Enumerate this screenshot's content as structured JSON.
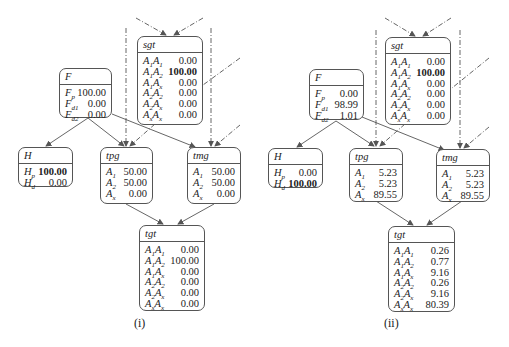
{
  "panels": [
    {
      "caption": "(i)",
      "nodes": {
        "sgt": {
          "title": "sgt",
          "rows": [
            {
              "label": "A1A1",
              "value": "0.00",
              "bold": false
            },
            {
              "label": "A1A2",
              "value": "100.00",
              "bold": true
            },
            {
              "label": "A1Ax",
              "value": "0.00",
              "bold": false
            },
            {
              "label": "A2A2",
              "value": "0.00",
              "bold": false
            },
            {
              "label": "A2Ax",
              "value": "0.00",
              "bold": false
            },
            {
              "label": "AxAx",
              "value": "0.00",
              "bold": false
            }
          ]
        },
        "F": {
          "title": "F",
          "rows": [
            {
              "label": "Fp",
              "value": "100.00",
              "bold": false
            },
            {
              "label": "Fd1",
              "value": "0.00",
              "bold": false
            },
            {
              "label": "Fd2",
              "value": "0.00",
              "bold": false
            }
          ]
        },
        "H": {
          "title": "H",
          "rows": [
            {
              "label": "Hp",
              "value": "100.00",
              "bold": true
            },
            {
              "label": "Hd",
              "value": "0.00",
              "bold": false
            }
          ]
        },
        "tpg": {
          "title": "tpg",
          "rows": [
            {
              "label": "A1",
              "value": "50.00",
              "bold": false
            },
            {
              "label": "A2",
              "value": "50.00",
              "bold": false
            },
            {
              "label": "Ax",
              "value": "0.00",
              "bold": false
            }
          ]
        },
        "tmg": {
          "title": "tmg",
          "rows": [
            {
              "label": "A1",
              "value": "50.00",
              "bold": false
            },
            {
              "label": "A2",
              "value": "50.00",
              "bold": false
            },
            {
              "label": "Ax",
              "value": "0.00",
              "bold": false
            }
          ]
        },
        "tgt": {
          "title": "tgt",
          "rows": [
            {
              "label": "A1A1",
              "value": "0.00",
              "bold": false
            },
            {
              "label": "A1A2",
              "value": "100.00",
              "bold": false
            },
            {
              "label": "A1Ax",
              "value": "0.00",
              "bold": false
            },
            {
              "label": "A2A2",
              "value": "0.00",
              "bold": false
            },
            {
              "label": "A2Ax",
              "value": "0.00",
              "bold": false
            },
            {
              "label": "AxAx",
              "value": "0.00",
              "bold": false
            }
          ]
        }
      }
    },
    {
      "caption": "(ii)",
      "nodes": {
        "sgt": {
          "title": "sgt",
          "rows": [
            {
              "label": "A1A1",
              "value": "0.00",
              "bold": false
            },
            {
              "label": "A1A2",
              "value": "100.00",
              "bold": true
            },
            {
              "label": "A1Ax",
              "value": "0.00",
              "bold": false
            },
            {
              "label": "A2A2",
              "value": "0.00",
              "bold": false
            },
            {
              "label": "A2Ax",
              "value": "0.00",
              "bold": false
            },
            {
              "label": "AxAx",
              "value": "0.00",
              "bold": false
            }
          ]
        },
        "F": {
          "title": "F",
          "rows": [
            {
              "label": "Fp",
              "value": "0.00",
              "bold": false
            },
            {
              "label": "Fd1",
              "value": "98.99",
              "bold": false
            },
            {
              "label": "Fd2",
              "value": "1.01",
              "bold": false
            }
          ]
        },
        "H": {
          "title": "H",
          "rows": [
            {
              "label": "Hp",
              "value": "0.00",
              "bold": false
            },
            {
              "label": "Hd",
              "value": "100.00",
              "bold": true
            }
          ]
        },
        "tpg": {
          "title": "tpg",
          "rows": [
            {
              "label": "A1",
              "value": "5.23",
              "bold": false
            },
            {
              "label": "A2",
              "value": "5.23",
              "bold": false
            },
            {
              "label": "Ax",
              "value": "89.55",
              "bold": false
            }
          ]
        },
        "tmg": {
          "title": "tmg",
          "rows": [
            {
              "label": "A1",
              "value": "5.23",
              "bold": false
            },
            {
              "label": "A2",
              "value": "5.23",
              "bold": false
            },
            {
              "label": "Ax",
              "value": "89.55",
              "bold": false
            }
          ]
        },
        "tgt": {
          "title": "tgt",
          "rows": [
            {
              "label": "A1A1",
              "value": "0.26",
              "bold": false
            },
            {
              "label": "A1A2",
              "value": "0.77",
              "bold": false
            },
            {
              "label": "A1Ax",
              "value": "9.16",
              "bold": false
            },
            {
              "label": "A2A2",
              "value": "0.26",
              "bold": false
            },
            {
              "label": "A2Ax",
              "value": "9.16",
              "bold": false
            },
            {
              "label": "AxAx",
              "value": "80.39",
              "bold": false
            }
          ]
        }
      }
    }
  ],
  "colors": {
    "line": "#555555",
    "dashed": "#666666",
    "text": "#222222"
  }
}
